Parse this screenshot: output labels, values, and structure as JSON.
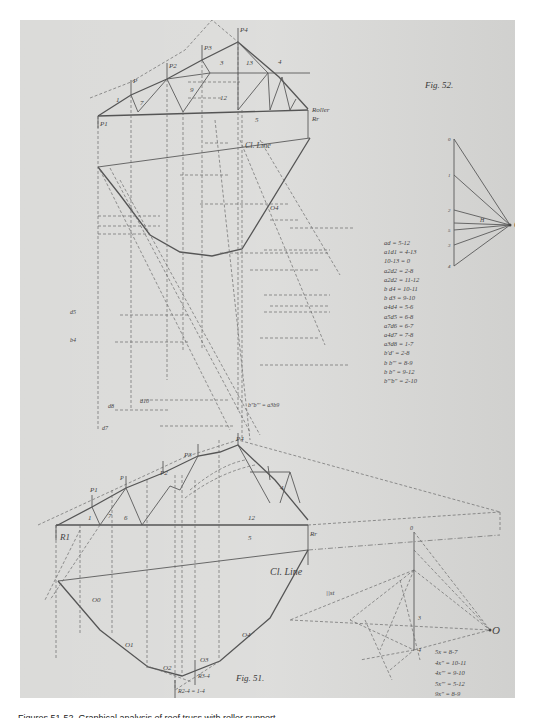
{
  "page": {
    "page_number_upper": "104",
    "page_number_lower": "103",
    "caption": "Figures 51-52. Graphical analysis of roof truss with roller support"
  },
  "fig52": {
    "title": "Fig. 52.",
    "support_label": "Roller",
    "reaction_right": "Rr",
    "loads": [
      "P1",
      "P",
      "P2",
      "P3",
      "P4"
    ],
    "member_numbers": [
      "1",
      "2",
      "3",
      "4",
      "5",
      "6",
      "7",
      "8",
      "9",
      "10",
      "11",
      "12",
      "13"
    ],
    "closing_line": "Cl. Line",
    "pole": "O",
    "pole_distance": "H",
    "funicular_labels": [
      "a1",
      "a2",
      "a3",
      "O4",
      "b",
      "b1",
      "b2",
      "b3",
      "d",
      "d1",
      "d2",
      "d3",
      "d4"
    ],
    "force_polygon_points": [
      "0",
      "1",
      "2",
      "5",
      "3",
      "4"
    ],
    "lower_labels": {
      "d7": "d7",
      "d10": "d10",
      "d8": "d8",
      "d5": "d5",
      "b4": "b4",
      "b_eq": "b\"b\"' = a3b9"
    },
    "equations": [
      "ad = 5-12",
      "a1d1 = 4-13",
      "10-13 = 0",
      "a2d2 = 2-8",
      "a2d2 = 11-12",
      "b d4 = 10-11",
      "b d3 = 9-10",
      "a4d4 = 5-6",
      "a5d5 = 6-8",
      "a7d6 = 6-7",
      "a4d7 = 7-8",
      "a3d8 = 1-7",
      "b'd' = 2-8",
      "b b\"' = 8-9",
      "b b\" = 9-12",
      "b\"'b\" = 2-10"
    ]
  },
  "fig51": {
    "title": "Fig. 51.",
    "reaction_left": "R1",
    "reaction_right": "Rr",
    "loads": [
      "P1",
      "P",
      "P2",
      "P3",
      "P4"
    ],
    "member_numbers": [
      "0",
      "1",
      "2",
      "3",
      "4",
      "5",
      "6",
      "7",
      "9",
      "12"
    ],
    "closing_line": "Cl. Line",
    "pole": "O",
    "funicular_labels": [
      "O0",
      "O1",
      "O2",
      "O3",
      "O4"
    ],
    "resultants": [
      "R3-4",
      "R2-4 = 1-4"
    ],
    "force_polygon_labels": [
      "0",
      "3",
      "4",
      "||st",
      "||3t1",
      "||4t4",
      "||8t1"
    ],
    "equations": [
      "5x = 8-7",
      "4x\" = 10-11",
      "4x\"' = 9-10",
      "5x\"' = 5-12",
      "9x\" = 8-9"
    ]
  }
}
